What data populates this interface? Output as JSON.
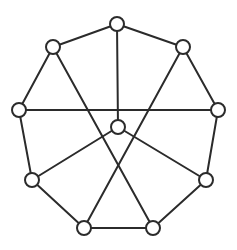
{
  "figure": {
    "kind": "graph-drawing",
    "width": 237,
    "height": 250,
    "background_color": "#ffffff"
  },
  "style": {
    "edge_color": "#2b2b2b",
    "edge_width": 2,
    "node_fill": "#ffffff",
    "node_stroke": "#2b2b2b",
    "node_stroke_width": 2,
    "node_radius": 7
  },
  "graph": {
    "node_count": 10,
    "edge_count": 15,
    "nodes": [
      {
        "id": "top",
        "label": "",
        "x": 117,
        "y": 24,
        "r": 7
      },
      {
        "id": "upper-left",
        "label": "",
        "x": 53,
        "y": 47,
        "r": 7
      },
      {
        "id": "upper-right",
        "label": "",
        "x": 183,
        "y": 47,
        "r": 7
      },
      {
        "id": "left",
        "label": "",
        "x": 19,
        "y": 110,
        "r": 7
      },
      {
        "id": "right",
        "label": "",
        "x": 218,
        "y": 110,
        "r": 7
      },
      {
        "id": "center",
        "label": "",
        "x": 118,
        "y": 127,
        "r": 7
      },
      {
        "id": "lower-left",
        "label": "",
        "x": 32,
        "y": 180,
        "r": 7
      },
      {
        "id": "lower-right",
        "label": "",
        "x": 206,
        "y": 180,
        "r": 7
      },
      {
        "id": "bottom-left",
        "label": "",
        "x": 84,
        "y": 228,
        "r": 7
      },
      {
        "id": "bottom-right",
        "label": "",
        "x": 153,
        "y": 228,
        "r": 7
      }
    ],
    "edges": [
      {
        "id": "ring-1",
        "from": "top",
        "to": "upper-left",
        "kind": "ring"
      },
      {
        "id": "ring-2",
        "from": "top",
        "to": "upper-right",
        "kind": "ring"
      },
      {
        "id": "ring-3",
        "from": "upper-left",
        "to": "left",
        "kind": "ring"
      },
      {
        "id": "ring-4",
        "from": "upper-right",
        "to": "right",
        "kind": "ring"
      },
      {
        "id": "ring-5",
        "from": "left",
        "to": "lower-left",
        "kind": "ring"
      },
      {
        "id": "ring-6",
        "from": "right",
        "to": "lower-right",
        "kind": "ring"
      },
      {
        "id": "ring-7",
        "from": "lower-left",
        "to": "bottom-left",
        "kind": "ring"
      },
      {
        "id": "ring-8",
        "from": "lower-right",
        "to": "bottom-right",
        "kind": "ring"
      },
      {
        "id": "ring-9",
        "from": "bottom-left",
        "to": "bottom-right",
        "kind": "ring"
      },
      {
        "id": "spoke-1",
        "from": "top",
        "to": "center",
        "kind": "spoke"
      },
      {
        "id": "spoke-2",
        "from": "center",
        "to": "lower-left",
        "kind": "spoke"
      },
      {
        "id": "spoke-3",
        "from": "center",
        "to": "lower-right",
        "kind": "spoke"
      },
      {
        "id": "chord-1",
        "from": "left",
        "to": "right",
        "kind": "chord"
      },
      {
        "id": "chord-2",
        "from": "upper-left",
        "to": "bottom-right",
        "kind": "chord"
      },
      {
        "id": "chord-3",
        "from": "upper-right",
        "to": "bottom-left",
        "kind": "chord"
      }
    ]
  }
}
